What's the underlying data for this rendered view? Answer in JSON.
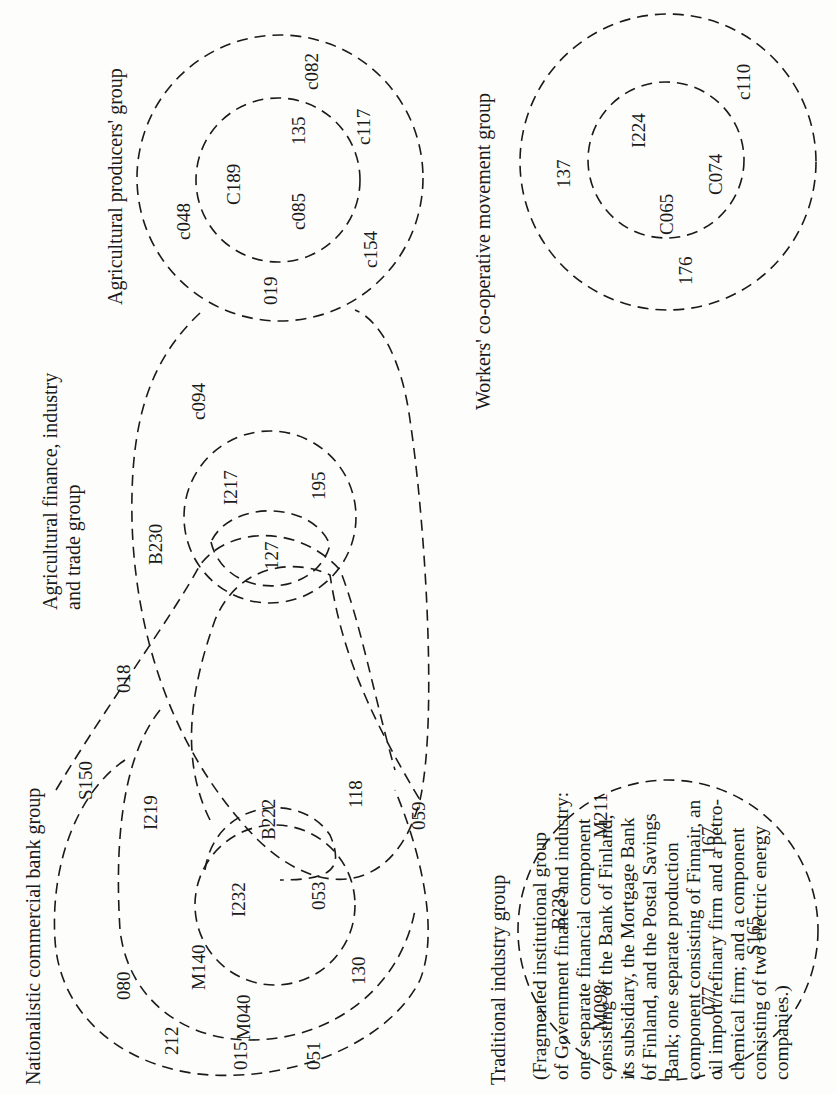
{
  "groups": {
    "agricultural_producers": {
      "title": "Agricultural producers' group",
      "outer_members": [
        "c048",
        "c082",
        "c117",
        "c154"
      ],
      "inner_members": [
        "C189",
        "135",
        "c085"
      ],
      "shared_with_agri_finance": [
        "019"
      ]
    },
    "agricultural_finance": {
      "title_line1": "Agricultural finance, industry",
      "title_line2": "and trade group",
      "outer_members": [
        "B230",
        "c094"
      ],
      "inner_members": [
        "I217",
        "195"
      ],
      "shared_inner": [
        "127"
      ]
    },
    "nationalistic_bank": {
      "title": "Nationalistic commercial bank group",
      "outer_members": [
        "S150",
        "080",
        "212",
        "015",
        "051",
        "130"
      ],
      "middle_members": [
        "I219",
        "M140",
        "M040"
      ],
      "inner_members": [
        "I232",
        "053"
      ],
      "shared": [
        "018",
        "B222",
        "118",
        "059"
      ]
    },
    "traditional_industry": {
      "title": "Traditional industry group",
      "members": [
        "B239",
        "M211",
        "M098",
        "167",
        "077",
        "S165"
      ]
    },
    "workers_cooperative": {
      "title": "Workers' co-operative movement group",
      "outer_members": [
        "137",
        "176",
        "c110"
      ],
      "inner_members": [
        "I224",
        "C065",
        "C074"
      ]
    },
    "fragmented_institutional": {
      "lines": [
        "(Fragmented institutional group",
        "of Government finance and industry:",
        "one separate financial component",
        "consisting of the Bank of Finland,",
        "its subsidiary, the Mortgage Bank",
        "of Finland, and the Postal Savings",
        "Bank; one separate production",
        "component consisting of Finnair, an",
        "oil import/refinary firm and a petro-",
        "chemical firm; and a component",
        "consisting of two electric energy",
        "companies.)"
      ]
    }
  }
}
